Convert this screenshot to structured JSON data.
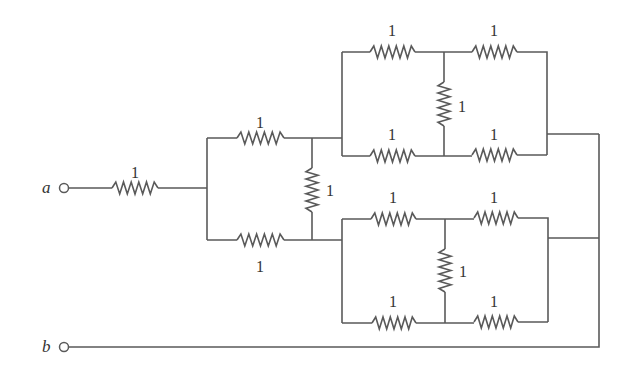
{
  "diagram": {
    "type": "resistor-network",
    "terminals": [
      {
        "id": "a",
        "label": "a",
        "x": 64,
        "y": 188
      },
      {
        "id": "b",
        "label": "b",
        "x": 64,
        "y": 347
      }
    ],
    "resistor_value_label": "1",
    "resistors": [
      {
        "id": "R1",
        "label": "1",
        "orientation": "h",
        "x1": 112,
        "x2": 158,
        "y": 188,
        "lx": 135,
        "ly": 178
      },
      {
        "id": "R2",
        "label": "1",
        "orientation": "h",
        "x1": 237,
        "x2": 284,
        "y": 138,
        "lx": 260,
        "ly": 128
      },
      {
        "id": "R3",
        "label": "1",
        "orientation": "h",
        "x1": 237,
        "x2": 284,
        "y": 240,
        "lx": 260,
        "ly": 272
      },
      {
        "id": "R4",
        "label": "1",
        "orientation": "v",
        "x": 312,
        "y1": 168,
        "y2": 212,
        "lx": 326,
        "ly": 196
      },
      {
        "id": "R5",
        "label": "1",
        "orientation": "h",
        "x1": 370,
        "x2": 415,
        "y": 52,
        "lx": 392,
        "ly": 36
      },
      {
        "id": "R6",
        "label": "1",
        "orientation": "h",
        "x1": 472,
        "x2": 517,
        "y": 52,
        "lx": 494,
        "ly": 36
      },
      {
        "id": "R7",
        "label": "1",
        "orientation": "v",
        "x": 444,
        "y1": 82,
        "y2": 126,
        "lx": 458,
        "ly": 112
      },
      {
        "id": "R8",
        "label": "1",
        "orientation": "h",
        "x1": 370,
        "x2": 415,
        "y": 156,
        "lx": 392,
        "ly": 140
      },
      {
        "id": "R9",
        "label": "1",
        "orientation": "h",
        "x1": 472,
        "x2": 517,
        "y": 155,
        "lx": 494,
        "ly": 140
      },
      {
        "id": "R10",
        "label": "1",
        "orientation": "h",
        "x1": 371,
        "x2": 416,
        "y": 219,
        "lx": 393,
        "ly": 203
      },
      {
        "id": "R11",
        "label": "1",
        "orientation": "h",
        "x1": 474,
        "x2": 518,
        "y": 218,
        "lx": 494,
        "ly": 203
      },
      {
        "id": "R12",
        "label": "1",
        "orientation": "v",
        "x": 445,
        "y1": 249,
        "y2": 292,
        "lx": 459,
        "ly": 277
      },
      {
        "id": "R13",
        "label": "1",
        "orientation": "h",
        "x1": 372,
        "x2": 416,
        "y": 323,
        "lx": 393,
        "ly": 307
      },
      {
        "id": "R14",
        "label": "1",
        "orientation": "h",
        "x1": 474,
        "x2": 518,
        "y": 322,
        "lx": 494,
        "ly": 307
      }
    ]
  }
}
